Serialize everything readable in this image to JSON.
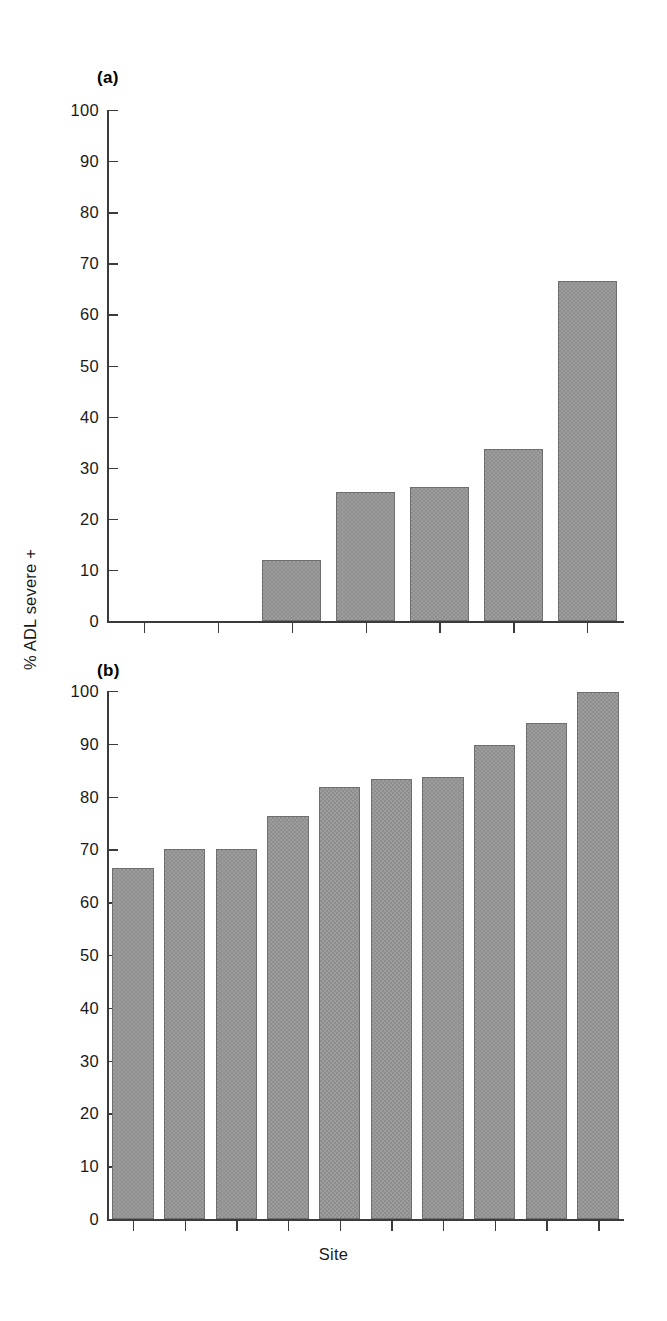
{
  "figure": {
    "y_axis_title": "% ADL severe +",
    "x_axis_title": "Site",
    "bar_color": "#8e8e8e",
    "bar_edge_color": "#6f6f6f",
    "axis_color": "#3b3b3b",
    "background": "#ffffff"
  },
  "panels": [
    {
      "label": "(a)"
    },
    {
      "label": "(b)"
    }
  ],
  "chart_data": [
    {
      "type": "bar",
      "title": "(a)",
      "panel": "a",
      "xlabel": "",
      "ylabel": "% ADL severe +",
      "ylim": [
        0,
        100
      ],
      "ytick_labels": [
        "100",
        "90",
        "80",
        "70",
        "60",
        "50",
        "40",
        "30",
        "20",
        "10",
        "0"
      ],
      "yticks": [
        100,
        90,
        80,
        70,
        60,
        50,
        40,
        30,
        20,
        10,
        0
      ],
      "grid": false,
      "legend": "none",
      "n_slots": 7,
      "categories": [
        "Site 1",
        "Site 2",
        "Site 3",
        "Site 4",
        "Site 5",
        "Site 6",
        "Site 7"
      ],
      "values": [
        0,
        0,
        12,
        25.2,
        26.2,
        33.7,
        66.6
      ],
      "bars_drawn_slots": [
        3,
        4,
        5,
        6,
        7
      ]
    },
    {
      "type": "bar",
      "title": "(b)",
      "panel": "b",
      "xlabel": "Site",
      "ylabel": "% ADL severe +",
      "ylim": [
        0,
        100
      ],
      "ytick_labels": [
        "100",
        "90",
        "80",
        "70",
        "60",
        "50",
        "40",
        "30",
        "20",
        "10",
        "0"
      ],
      "yticks": [
        100,
        90,
        80,
        70,
        60,
        50,
        40,
        30,
        20,
        10,
        0
      ],
      "grid": false,
      "legend": "none",
      "n_slots": 10,
      "categories": [
        "Site 1",
        "Site 2",
        "Site 3",
        "Site 4",
        "Site 5",
        "Site 6",
        "Site 7",
        "Site 8",
        "Site 9",
        "Site 10"
      ],
      "values": [
        66.5,
        70.0,
        70.0,
        76.4,
        81.8,
        83.4,
        83.8,
        89.8,
        94.0,
        99.8
      ],
      "bars_drawn_slots": [
        1,
        2,
        3,
        4,
        5,
        6,
        7,
        8,
        9,
        10
      ]
    }
  ]
}
